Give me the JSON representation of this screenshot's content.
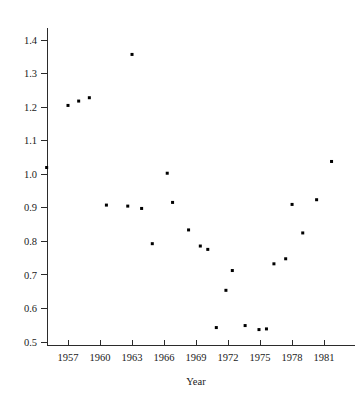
{
  "chart_data": {
    "type": "scatter",
    "title": "",
    "subtitle": "",
    "xlabel": "Year",
    "ylabel": "",
    "xlim": [
      1954.2,
      1983.5
    ],
    "ylim": [
      0.455,
      1.45
    ],
    "grid": false,
    "legend": null,
    "xticks": [
      1957,
      1960,
      1963,
      1966,
      1969,
      1972,
      1975,
      1978,
      1981
    ],
    "xticklabels": [
      "1957",
      "1960",
      "1963",
      "1966",
      "1969",
      "1972",
      "1975",
      "1978",
      "1981"
    ],
    "yticks": [
      0.5,
      0.6,
      0.7,
      0.8,
      0.9,
      1.0,
      1.1,
      1.2,
      1.3,
      1.4
    ],
    "yticklabels": [
      "0.5",
      "0.6",
      "0.7",
      "0.8",
      "0.9",
      "1.0",
      "1.1",
      "1.2",
      "1.3",
      "1.4"
    ],
    "marker": "square",
    "marker_size": 3,
    "marker_color": "#000000",
    "x": [
      1955,
      1957,
      1958,
      1959,
      1960.6,
      1962.6,
      1963.0,
      1963.9,
      1964.9,
      1966.3,
      1966.8,
      1968.3,
      1969.4,
      1970.1,
      1970.9,
      1971.8,
      1972.4,
      1973.6,
      1974.9,
      1975.6,
      1976.3,
      1977.4,
      1978.0,
      1979.0,
      1980.3,
      1981.7
    ],
    "y": [
      1.02,
      1.205,
      1.218,
      1.228,
      0.908,
      0.905,
      1.357,
      0.898,
      0.793,
      1.003,
      0.916,
      0.834,
      0.786,
      0.776,
      0.543,
      0.654,
      0.713,
      0.549,
      0.537,
      0.539,
      0.733,
      0.748,
      0.91,
      0.825,
      0.924,
      1.038
    ],
    "points": [
      {
        "x": 1955,
        "y": 1.02
      },
      {
        "x": 1957,
        "y": 1.205
      },
      {
        "x": 1958,
        "y": 1.218
      },
      {
        "x": 1959,
        "y": 1.228
      },
      {
        "x": 1960.6,
        "y": 0.908
      },
      {
        "x": 1962.6,
        "y": 0.905
      },
      {
        "x": 1963.0,
        "y": 1.357
      },
      {
        "x": 1963.9,
        "y": 0.898
      },
      {
        "x": 1964.9,
        "y": 0.793
      },
      {
        "x": 1966.3,
        "y": 1.003
      },
      {
        "x": 1966.8,
        "y": 0.916
      },
      {
        "x": 1968.3,
        "y": 0.834
      },
      {
        "x": 1969.4,
        "y": 0.786
      },
      {
        "x": 1970.1,
        "y": 0.776
      },
      {
        "x": 1970.9,
        "y": 0.543
      },
      {
        "x": 1971.8,
        "y": 0.654
      },
      {
        "x": 1972.4,
        "y": 0.713
      },
      {
        "x": 1973.6,
        "y": 0.549
      },
      {
        "x": 1974.9,
        "y": 0.537
      },
      {
        "x": 1975.6,
        "y": 0.539
      },
      {
        "x": 1976.3,
        "y": 0.733
      },
      {
        "x": 1977.4,
        "y": 0.748
      },
      {
        "x": 1978.0,
        "y": 0.91
      },
      {
        "x": 1979.0,
        "y": 0.825
      },
      {
        "x": 1980.3,
        "y": 0.924
      },
      {
        "x": 1981.7,
        "y": 1.038
      }
    ]
  }
}
